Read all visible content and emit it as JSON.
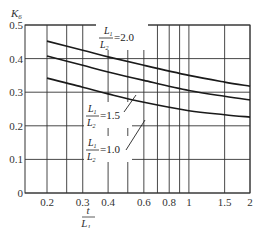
{
  "chart_data": {
    "type": "line",
    "title": "",
    "xlabel": "t / L1",
    "ylabel": "K6",
    "x_scale": "log",
    "xlim": [
      0.156,
      2
    ],
    "ylim": [
      0,
      0.5
    ],
    "grid": true,
    "x_ticks": [
      0.2,
      0.3,
      0.4,
      0.6,
      0.8,
      1,
      1.5,
      2
    ],
    "x_tick_labels": [
      "0.2",
      "0.3",
      "0.4",
      "0.6",
      "0.8",
      "1",
      "1.5",
      "2"
    ],
    "x_gridlines": [
      0.2,
      0.25,
      0.3,
      0.4,
      0.5,
      0.6,
      0.7,
      0.8,
      0.9,
      1,
      1.5,
      2
    ],
    "y_ticks": [
      0,
      0.1,
      0.2,
      0.3,
      0.4,
      0.5
    ],
    "y_tick_labels": [
      "0",
      "0.1",
      "0.2",
      "0.3",
      "0.4",
      "0.5"
    ],
    "x": [
      0.2,
      0.3,
      0.4,
      0.6,
      1.0,
      1.5,
      2.0
    ],
    "series": [
      {
        "name": "L1/L2 = 2.0",
        "values": [
          0.452,
          0.425,
          0.405,
          0.38,
          0.35,
          0.33,
          0.318
        ]
      },
      {
        "name": "L1/L2 = 1.5",
        "values": [
          0.408,
          0.38,
          0.36,
          0.335,
          0.305,
          0.288,
          0.277
        ]
      },
      {
        "name": "L1/L2 = 1.0",
        "values": [
          0.342,
          0.315,
          0.295,
          0.27,
          0.245,
          0.233,
          0.226
        ]
      }
    ],
    "annotations": [
      {
        "numerator": "L1",
        "denominator": "L2",
        "value": "=2.0"
      },
      {
        "numerator": "L1",
        "denominator": "L2",
        "value": "=1.5"
      },
      {
        "numerator": "L1",
        "denominator": "L2",
        "value": "=1.0"
      }
    ]
  },
  "axis": {
    "y_title_main": "K",
    "y_title_sub": "6",
    "x_title_num": "t",
    "x_title_den": "L",
    "x_title_den_sub": "1"
  },
  "labels": {
    "l1": "L",
    "l1_sub": "1",
    "l2": "L",
    "l2_sub": "2",
    "v20": "=2.0",
    "v15": "=1.5",
    "v10": "=1.0"
  },
  "colors": {
    "line": "#1a1a1a",
    "grid": "#333333"
  }
}
